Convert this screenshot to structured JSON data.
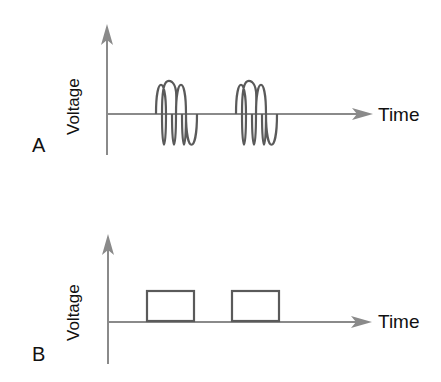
{
  "panels": [
    {
      "letter": "A",
      "y_label": "Voltage",
      "x_label": "Time",
      "signal": "sine bursts",
      "bursts": 2
    },
    {
      "letter": "B",
      "y_label": "Voltage",
      "x_label": "Time",
      "signal": "rectangular pulses",
      "pulses": 2
    }
  ],
  "colors": {
    "axis": "#8a8a8a",
    "signal": "#5a5a5a",
    "text": "#111111"
  }
}
